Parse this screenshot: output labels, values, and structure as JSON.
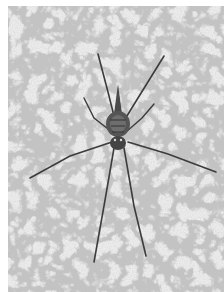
{
  "image": {
    "subject": "spider on textured stone surface",
    "style": "grayscale photograph",
    "colors": {
      "background": "#ffffff",
      "surface": "#ebebeb",
      "speckle": "#9a9a9a",
      "spider_body": "#4a4a4a",
      "legs": "#3a3a3a"
    }
  }
}
